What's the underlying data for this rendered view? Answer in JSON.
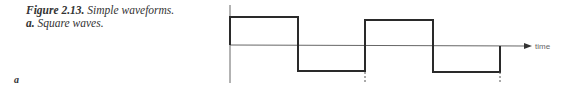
{
  "caption": {
    "figure_label": "Figure 2.13.",
    "title": "Simple waveforms.",
    "sub_label": "a.",
    "sub_title": "Square waves."
  },
  "panel_label": "a",
  "diagram": {
    "type": "square-wave",
    "x_axis_label": "time",
    "stroke_color": "#222222",
    "axis_color": "#555555"
  }
}
